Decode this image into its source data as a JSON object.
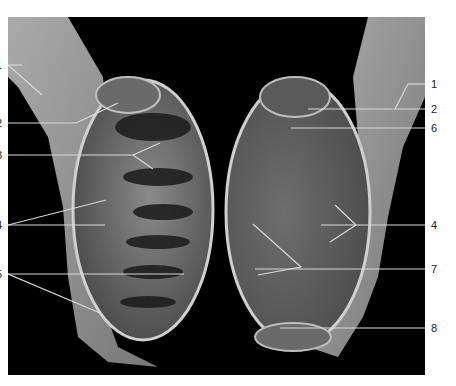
{
  "figure": {
    "caption_clipped": "",
    "left_labels": [
      {
        "text": "1",
        "y": 65
      },
      {
        "text": "2",
        "y": 123
      },
      {
        "text": "3",
        "y": 155
      },
      {
        "text": "4",
        "y": 225
      },
      {
        "text": "5",
        "y": 274
      }
    ],
    "right_labels": [
      {
        "text": "1",
        "y": 84
      },
      {
        "text": "2",
        "y": 109
      },
      {
        "text": "6",
        "y": 128
      },
      {
        "text": "4",
        "y": 225
      },
      {
        "text": "7",
        "y": 269
      },
      {
        "text": "8",
        "y": 328
      }
    ],
    "colors": {
      "background": "#000000",
      "leader": "#d8d8d8",
      "tissue_light": "#bdbdbd",
      "tissue_dark": "#5a5a5a"
    }
  }
}
